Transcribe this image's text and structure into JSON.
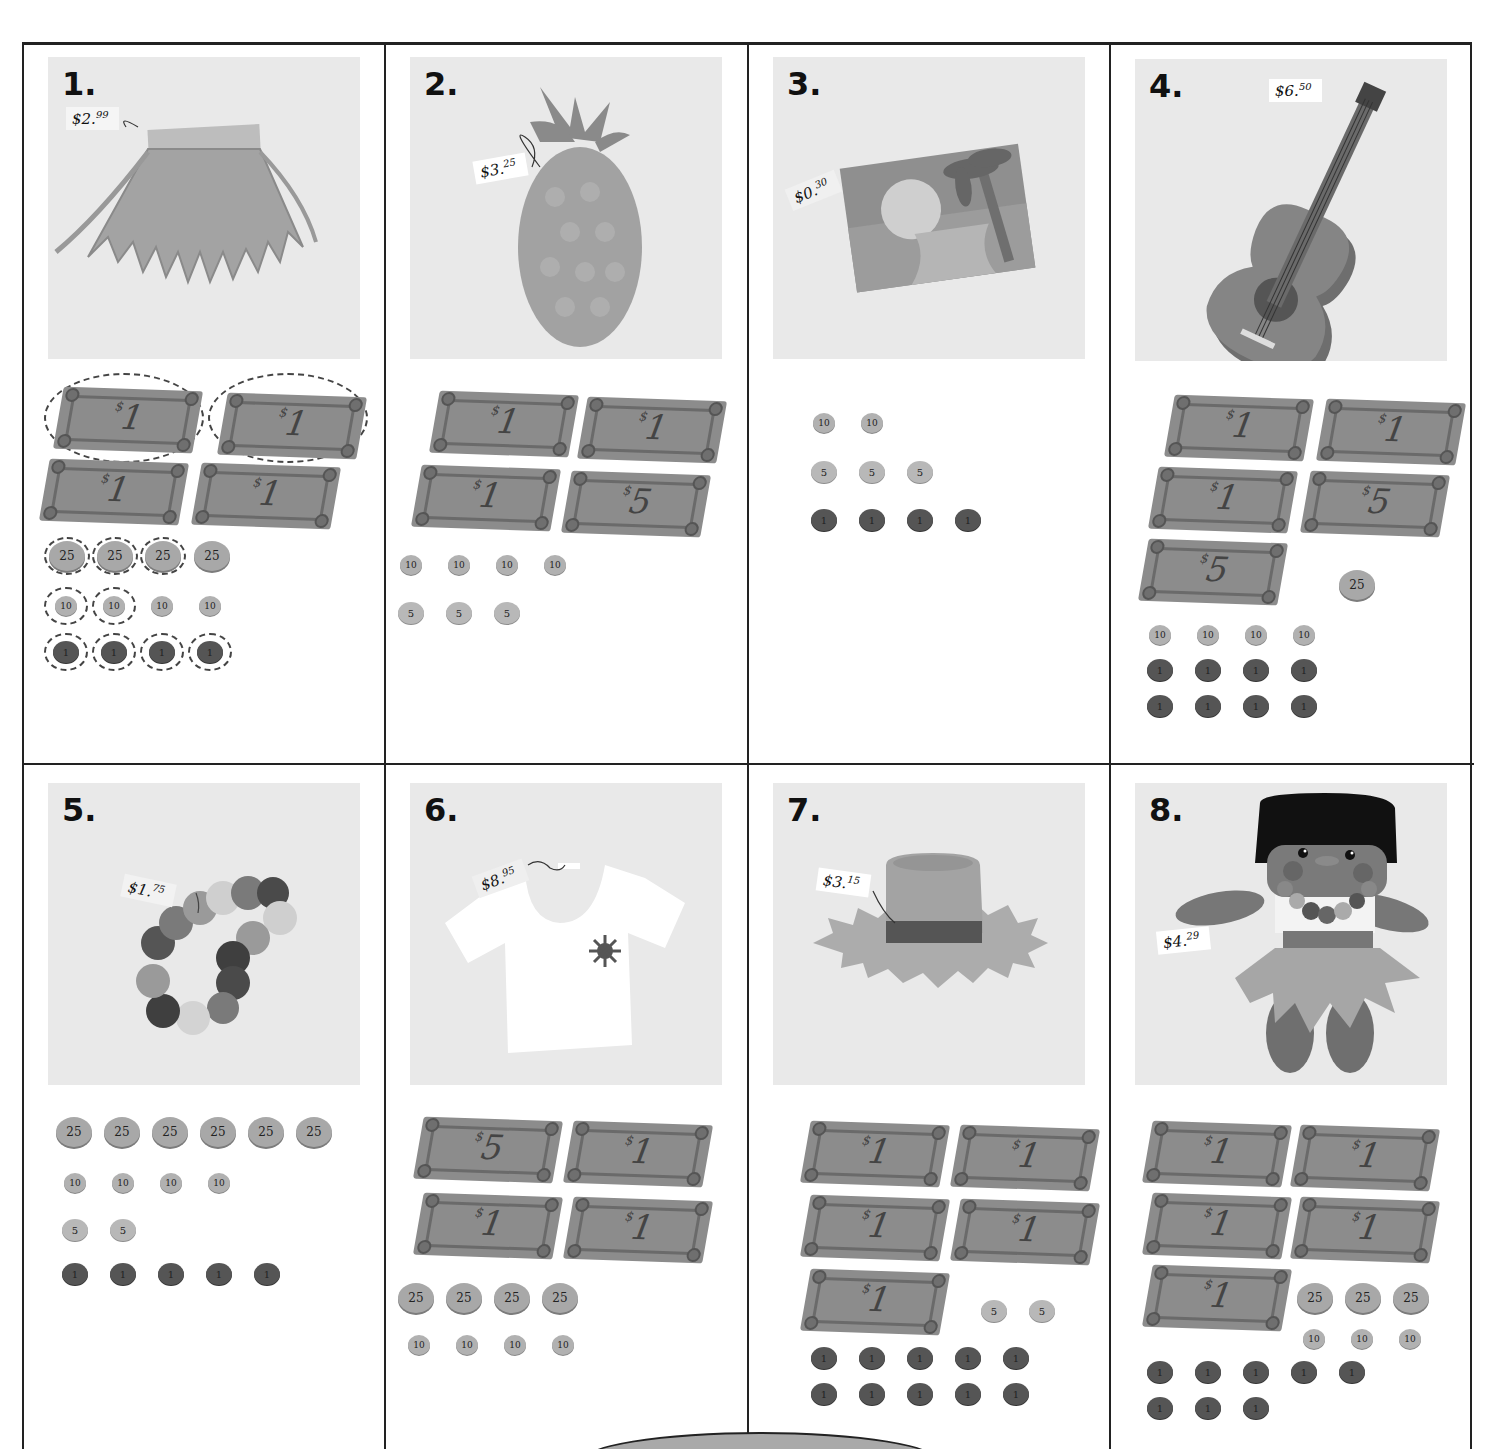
{
  "page": {
    "grid_columns": 4,
    "grid_rows": 2
  },
  "problems": [
    {
      "number": "1.",
      "item": "grass skirt",
      "price": {
        "dollars": "$2",
        "cents": "99",
        "full": "$2.99"
      },
      "bills": [
        "1",
        "1",
        "1",
        "1"
      ],
      "coins": {
        "quarters": [
          "25",
          "25",
          "25",
          "25"
        ],
        "dimes": [
          "10",
          "10",
          "10",
          "10"
        ],
        "nickels": [],
        "pennies": [
          "1",
          "1",
          "1",
          "1"
        ]
      },
      "circled": {
        "bills": 2,
        "quarters": 3,
        "dimes": 2,
        "pennies": 4
      }
    },
    {
      "number": "2.",
      "item": "pineapple",
      "price": {
        "dollars": "$3",
        "cents": "25",
        "full": "$3.25"
      },
      "bills": [
        "1",
        "1",
        "1",
        "5"
      ],
      "coins": {
        "quarters": [],
        "dimes": [
          "10",
          "10",
          "10",
          "10"
        ],
        "nickels": [
          "5",
          "5",
          "5"
        ],
        "pennies": []
      }
    },
    {
      "number": "3.",
      "item": "postcard",
      "price": {
        "dollars": "$0",
        "cents": "30",
        "full": "$0.30"
      },
      "bills": [],
      "coins": {
        "quarters": [],
        "dimes": [
          "10",
          "10"
        ],
        "nickels": [
          "5",
          "5",
          "5"
        ],
        "pennies": [
          "1",
          "1",
          "1",
          "1"
        ]
      }
    },
    {
      "number": "4.",
      "item": "ukulele",
      "price": {
        "dollars": "$6",
        "cents": "50",
        "full": "$6.50"
      },
      "bills": [
        "1",
        "1",
        "1",
        "5",
        "5"
      ],
      "coins": {
        "quarters": [
          "25"
        ],
        "dimes": [
          "10",
          "10",
          "10",
          "10"
        ],
        "nickels": [],
        "pennies": [
          "1",
          "1",
          "1",
          "1",
          "1",
          "1",
          "1",
          "1"
        ]
      }
    },
    {
      "number": "5.",
      "item": "flower lei",
      "price": {
        "dollars": "$1",
        "cents": "75",
        "full": "$1.75"
      },
      "bills": [],
      "coins": {
        "quarters": [
          "25",
          "25",
          "25",
          "25",
          "25",
          "25"
        ],
        "dimes": [
          "10",
          "10",
          "10",
          "10"
        ],
        "nickels": [
          "5",
          "5"
        ],
        "pennies": [
          "1",
          "1",
          "1",
          "1",
          "1"
        ]
      }
    },
    {
      "number": "6.",
      "item": "t-shirt",
      "price": {
        "dollars": "$8",
        "cents": "95",
        "full": "$8.95"
      },
      "bills": [
        "5",
        "1",
        "1",
        "1"
      ],
      "coins": {
        "quarters": [
          "25",
          "25",
          "25",
          "25"
        ],
        "dimes": [
          "10",
          "10",
          "10",
          "10"
        ],
        "nickels": [],
        "pennies": []
      }
    },
    {
      "number": "7.",
      "item": "straw hat",
      "price": {
        "dollars": "$3",
        "cents": "15",
        "full": "$3.15"
      },
      "bills": [
        "1",
        "1",
        "1",
        "1",
        "1"
      ],
      "coins": {
        "quarters": [],
        "dimes": [],
        "nickels": [
          "5",
          "5"
        ],
        "pennies": [
          "1",
          "1",
          "1",
          "1",
          "1",
          "1",
          "1",
          "1",
          "1",
          "1"
        ]
      }
    },
    {
      "number": "8.",
      "item": "hula doll",
      "price": {
        "dollars": "$4",
        "cents": "29",
        "full": "$4.29"
      },
      "bills": [
        "1",
        "1",
        "1",
        "1",
        "1"
      ],
      "coins": {
        "quarters": [
          "25",
          "25",
          "25"
        ],
        "dimes": [
          "10",
          "10",
          "10"
        ],
        "nickels": [],
        "pennies": [
          "1",
          "1",
          "1",
          "1",
          "1",
          "1",
          "1",
          "1"
        ]
      }
    }
  ],
  "colors": {
    "panel_bg": "#e9e9e9",
    "bill": "#8c8c8c",
    "penny": "#555555",
    "quarter": "#a8a8a8",
    "border": "#222222"
  }
}
